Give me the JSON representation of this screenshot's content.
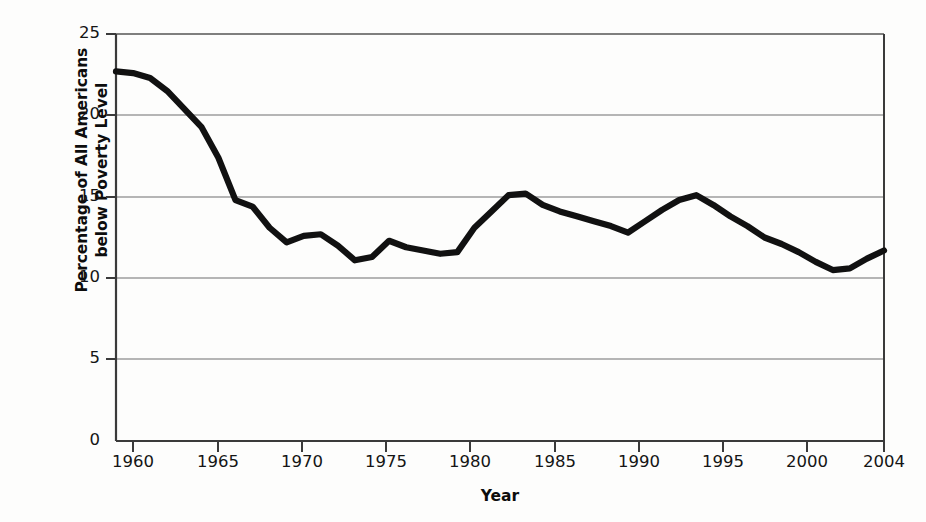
{
  "chart_data": {
    "type": "line",
    "title": "",
    "xlabel": "Year",
    "ylabel": "Percentage of All Americans below Poverty Level",
    "ylabel_line1": "Percentage of All Americans",
    "ylabel_line2": "below Poverty Level",
    "xlim": [
      1959,
      2004
    ],
    "ylim": [
      0,
      25
    ],
    "grid": "horizontal",
    "legend": "none",
    "line_color": "#111111",
    "axis_color": "#3a3a3a",
    "grid_color": "#6f6f6f",
    "background_color": "#fdfdfc",
    "yticks": [
      0,
      5,
      10,
      15,
      20,
      25
    ],
    "ytick_labels": [
      "0",
      "5",
      "10",
      "15",
      "20",
      "25"
    ],
    "xticks": [
      1960,
      1965,
      1970,
      1975,
      1980,
      1985,
      1990,
      1995,
      2000,
      2004
    ],
    "xtick_labels": [
      "1960",
      "1965",
      "1970",
      "1975",
      "1980",
      "1985",
      "1990",
      "1995",
      "2000",
      "2004"
    ],
    "x": [
      1959,
      1960,
      1961,
      1962,
      1963,
      1964,
      1965,
      1966,
      1967,
      1968,
      1969,
      1970,
      1971,
      1972,
      1973,
      1974,
      1975,
      1976,
      1977,
      1978,
      1979,
      1980,
      1981,
      1982,
      1983,
      1984,
      1985,
      1986,
      1987,
      1988,
      1989,
      1990,
      1991,
      1992,
      1993,
      1994,
      1995,
      1996,
      1997,
      1998,
      1999,
      2000,
      2001,
      2002,
      2003,
      2004
    ],
    "values": [
      22.7,
      22.6,
      22.3,
      21.5,
      20.4,
      19.3,
      17.4,
      14.8,
      14.4,
      13.1,
      12.2,
      12.6,
      12.7,
      12.0,
      11.1,
      11.3,
      12.3,
      11.9,
      11.7,
      11.5,
      11.6,
      13.1,
      14.1,
      15.1,
      15.2,
      14.5,
      14.1,
      13.8,
      13.5,
      13.2,
      12.8,
      13.5,
      14.2,
      14.8,
      15.1,
      14.5,
      13.8,
      13.2,
      12.5,
      12.1,
      11.6,
      11.0,
      10.5,
      10.6,
      11.2,
      11.7
    ]
  }
}
